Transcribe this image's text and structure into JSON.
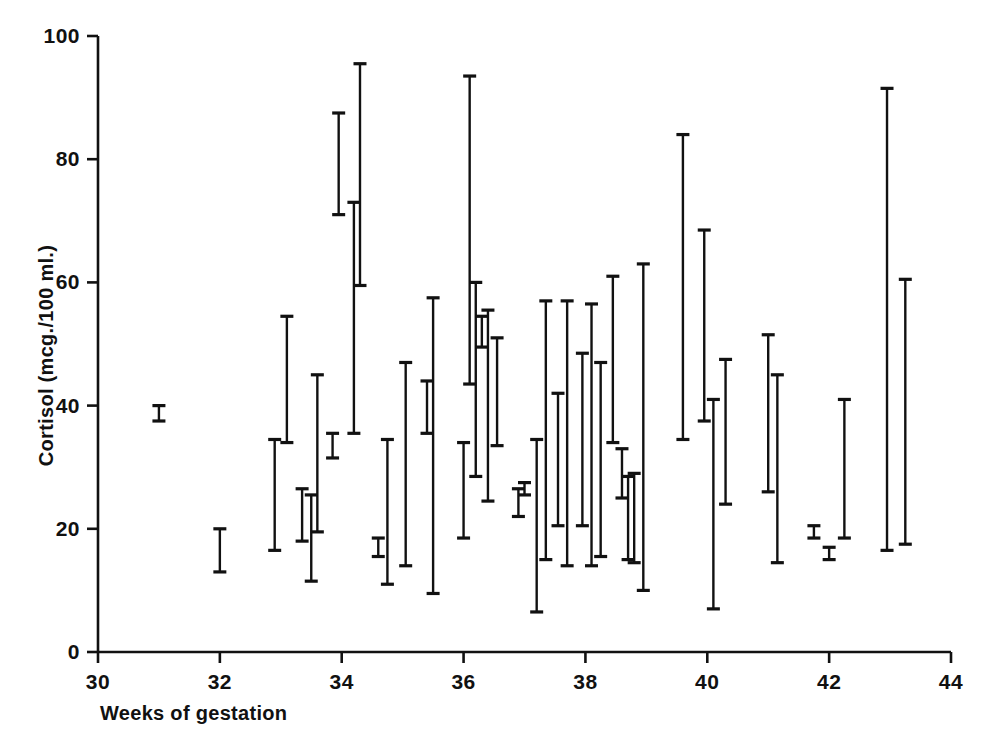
{
  "chart_data": {
    "type": "range-bar",
    "title": "",
    "xlabel": "Weeks of gestation",
    "ylabel": "Cortisol (mcg./100 ml.)",
    "xlim": [
      30,
      44
    ],
    "ylim": [
      0,
      100
    ],
    "xticks": [
      30,
      32,
      34,
      36,
      38,
      40,
      42,
      44
    ],
    "xtick_labels": [
      "30",
      "32",
      "34",
      "36",
      "38",
      "40",
      "42",
      "44"
    ],
    "yticks": [
      0,
      20,
      40,
      60,
      80,
      100
    ],
    "ytick_labels": [
      "0",
      "20",
      "40",
      "60",
      "80",
      "100"
    ],
    "grid": false,
    "legend": null,
    "marker": "vertical range bar with horizontal end caps",
    "series_color": "#111111",
    "n_points": 44,
    "x": [
      31.0,
      32.0,
      32.9,
      33.1,
      33.35,
      33.5,
      33.6,
      33.85,
      33.95,
      34.2,
      34.3,
      34.6,
      34.75,
      35.05,
      35.4,
      35.5,
      36.0,
      36.1,
      36.2,
      36.3,
      36.4,
      36.55,
      36.9,
      37.0,
      37.2,
      37.35,
      37.55,
      37.7,
      37.95,
      38.1,
      38.25,
      38.45,
      38.6,
      38.7,
      38.8,
      38.95,
      39.6,
      39.95,
      40.1,
      40.3,
      41.0,
      41.15,
      41.75,
      42.0,
      42.25,
      42.95,
      43.25
    ],
    "low": [
      37.5,
      13.0,
      16.5,
      34.0,
      18.0,
      11.5,
      19.5,
      31.5,
      71.0,
      35.5,
      59.5,
      15.5,
      11.0,
      14.0,
      35.5,
      9.5,
      18.5,
      43.5,
      28.5,
      49.5,
      24.5,
      33.5,
      22.0,
      25.5,
      6.5,
      15.0,
      20.5,
      14.0,
      20.5,
      14.0,
      15.5,
      34.0,
      25.0,
      15.0,
      14.5,
      10.0,
      34.5,
      37.5,
      7.0,
      24.0,
      26.0,
      14.5,
      18.5,
      15.0,
      18.5,
      16.5,
      17.5
    ],
    "high": [
      40.0,
      20.0,
      34.5,
      54.5,
      26.5,
      25.5,
      45.0,
      35.5,
      87.5,
      73.0,
      95.5,
      18.5,
      34.5,
      47.0,
      44.0,
      57.5,
      34.0,
      93.5,
      60.0,
      54.5,
      55.5,
      51.0,
      26.5,
      27.5,
      34.5,
      57.0,
      42.0,
      57.0,
      48.5,
      56.5,
      47.0,
      61.0,
      33.0,
      28.5,
      29.0,
      63.0,
      84.0,
      68.5,
      41.0,
      47.5,
      51.5,
      45.0,
      20.5,
      17.0,
      41.0,
      91.5,
      60.5
    ],
    "points": [
      {
        "week": 31.0,
        "low": 37.5,
        "high": 40.0
      },
      {
        "week": 32.0,
        "low": 13.0,
        "high": 20.0
      },
      {
        "week": 32.9,
        "low": 16.5,
        "high": 34.5
      },
      {
        "week": 33.1,
        "low": 34.0,
        "high": 54.5
      },
      {
        "week": 33.35,
        "low": 18.0,
        "high": 26.5
      },
      {
        "week": 33.5,
        "low": 11.5,
        "high": 25.5
      },
      {
        "week": 33.6,
        "low": 19.5,
        "high": 45.0
      },
      {
        "week": 33.85,
        "low": 31.5,
        "high": 35.5
      },
      {
        "week": 33.95,
        "low": 71.0,
        "high": 87.5
      },
      {
        "week": 34.2,
        "low": 35.5,
        "high": 73.0
      },
      {
        "week": 34.3,
        "low": 59.5,
        "high": 95.5
      },
      {
        "week": 34.6,
        "low": 15.5,
        "high": 18.5
      },
      {
        "week": 34.75,
        "low": 11.0,
        "high": 34.5
      },
      {
        "week": 35.05,
        "low": 14.0,
        "high": 47.0
      },
      {
        "week": 35.4,
        "low": 35.5,
        "high": 44.0
      },
      {
        "week": 35.5,
        "low": 9.5,
        "high": 57.5
      },
      {
        "week": 36.0,
        "low": 18.5,
        "high": 34.0
      },
      {
        "week": 36.1,
        "low": 43.5,
        "high": 93.5
      },
      {
        "week": 36.2,
        "low": 28.5,
        "high": 60.0
      },
      {
        "week": 36.3,
        "low": 49.5,
        "high": 54.5
      },
      {
        "week": 36.4,
        "low": 24.5,
        "high": 55.5
      },
      {
        "week": 36.55,
        "low": 33.5,
        "high": 51.0
      },
      {
        "week": 36.9,
        "low": 22.0,
        "high": 26.5
      },
      {
        "week": 37.0,
        "low": 25.5,
        "high": 27.5
      },
      {
        "week": 37.2,
        "low": 6.5,
        "high": 34.5
      },
      {
        "week": 37.35,
        "low": 15.0,
        "high": 57.0
      },
      {
        "week": 37.55,
        "low": 20.5,
        "high": 42.0
      },
      {
        "week": 37.7,
        "low": 14.0,
        "high": 57.0
      },
      {
        "week": 37.95,
        "low": 20.5,
        "high": 48.5
      },
      {
        "week": 38.1,
        "low": 14.0,
        "high": 56.5
      },
      {
        "week": 38.25,
        "low": 15.5,
        "high": 47.0
      },
      {
        "week": 38.45,
        "low": 34.0,
        "high": 61.0
      },
      {
        "week": 38.6,
        "low": 25.0,
        "high": 33.0
      },
      {
        "week": 38.7,
        "low": 15.0,
        "high": 28.5
      },
      {
        "week": 38.8,
        "low": 14.5,
        "high": 29.0
      },
      {
        "week": 38.95,
        "low": 10.0,
        "high": 63.0
      },
      {
        "week": 39.6,
        "low": 34.5,
        "high": 84.0
      },
      {
        "week": 39.95,
        "low": 37.5,
        "high": 68.5
      },
      {
        "week": 40.1,
        "low": 7.0,
        "high": 41.0
      },
      {
        "week": 40.3,
        "low": 24.0,
        "high": 47.5
      },
      {
        "week": 41.0,
        "low": 26.0,
        "high": 51.5
      },
      {
        "week": 41.15,
        "low": 14.5,
        "high": 45.0
      },
      {
        "week": 41.75,
        "low": 18.5,
        "high": 20.5
      },
      {
        "week": 42.0,
        "low": 15.0,
        "high": 17.0
      },
      {
        "week": 42.25,
        "low": 18.5,
        "high": 41.0
      },
      {
        "week": 42.95,
        "low": 16.5,
        "high": 91.5
      },
      {
        "week": 43.25,
        "low": 17.5,
        "high": 60.5
      }
    ]
  },
  "axes": {
    "y_title": "Cortisol (mcg./100 ml.)",
    "x_title": "Weeks of gestation"
  }
}
